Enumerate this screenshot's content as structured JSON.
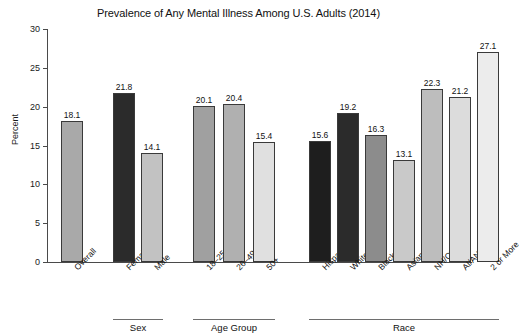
{
  "chart_data": {
    "type": "bar",
    "title": "Prevalence of Any Mental Illness Among U.S. Adults (2014)",
    "xlabel": "",
    "ylabel": "Percent",
    "ylim": [
      0,
      30
    ],
    "yticks": [
      0,
      5,
      10,
      15,
      20,
      25,
      30
    ],
    "grid": false,
    "legend": "none",
    "categories": [
      "Overall",
      "Female",
      "Male",
      "18–25",
      "26–49",
      "50+",
      "Hispanic",
      "White",
      "Black",
      "Asian",
      "NH/OPI*",
      "AI/AN**",
      "2 or More"
    ],
    "values": [
      18.1,
      21.8,
      14.1,
      20.1,
      20.4,
      15.4,
      15.6,
      19.2,
      16.3,
      13.1,
      22.3,
      21.2,
      27.1
    ],
    "bar_colors": [
      "#a9a9a9",
      "#2b2b2b",
      "#c2c2c2",
      "#a0a0a0",
      "#b0b0b0",
      "#e0e0e0",
      "#1e1e1e",
      "#2b2b2b",
      "#8c8c8c",
      "#c9c9c9",
      "#bdbdbd",
      "#dcdcdc",
      "#ececec"
    ],
    "groups": [
      {
        "label": "Sex",
        "start": 1,
        "end": 2
      },
      {
        "label": "Age Group",
        "start": 3,
        "end": 5
      },
      {
        "label": "Race",
        "start": 6,
        "end": 12
      }
    ]
  },
  "ytick_labels": [
    "0",
    "5",
    "10",
    "15",
    "20",
    "25",
    "30"
  ],
  "value_labels": [
    "18.1",
    "21.8",
    "14.1",
    "20.1",
    "20.4",
    "15.4",
    "15.6",
    "19.2",
    "16.3",
    "13.1",
    "22.3",
    "21.2",
    "27.1"
  ]
}
